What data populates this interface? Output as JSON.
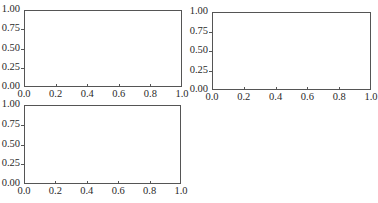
{
  "chart_data": [
    {
      "type": "line",
      "title": "",
      "xlabel": "",
      "ylabel": "",
      "xlim": [
        0.0,
        1.0
      ],
      "ylim": [
        0.0,
        1.0
      ],
      "x_ticks": [
        "0.0",
        "0.2",
        "0.4",
        "0.6",
        "0.8",
        "1.0"
      ],
      "y_ticks": [
        "0.00",
        "0.25",
        "0.50",
        "0.75",
        "1.00"
      ],
      "series": [],
      "grid": false,
      "legend": null,
      "position": "top-left"
    },
    {
      "type": "line",
      "title": "",
      "xlabel": "",
      "ylabel": "",
      "xlim": [
        0.0,
        1.0
      ],
      "ylim": [
        0.0,
        1.0
      ],
      "x_ticks": [
        "0.0",
        "0.2",
        "0.4",
        "0.6",
        "0.8",
        "1.0"
      ],
      "y_ticks": [
        "0.00",
        "0.25",
        "0.50",
        "0.75",
        "1.00"
      ],
      "series": [],
      "grid": false,
      "legend": null,
      "position": "top-right"
    },
    {
      "type": "line",
      "title": "",
      "xlabel": "",
      "ylabel": "",
      "xlim": [
        0.0,
        1.0
      ],
      "ylim": [
        0.0,
        1.0
      ],
      "x_ticks": [
        "0.0",
        "0.2",
        "0.4",
        "0.6",
        "0.8",
        "1.0"
      ],
      "y_ticks": [
        "0.00",
        "0.25",
        "0.50",
        "0.75",
        "1.00"
      ],
      "series": [],
      "grid": false,
      "legend": null,
      "position": "bottom-left"
    }
  ],
  "axes": [
    {
      "box": {
        "left": 24,
        "top": 10,
        "right": 182,
        "bottom": 87
      }
    },
    {
      "box": {
        "left": 212,
        "top": 12,
        "right": 371,
        "bottom": 90
      }
    },
    {
      "box": {
        "left": 24,
        "top": 105,
        "right": 181,
        "bottom": 184
      }
    }
  ]
}
